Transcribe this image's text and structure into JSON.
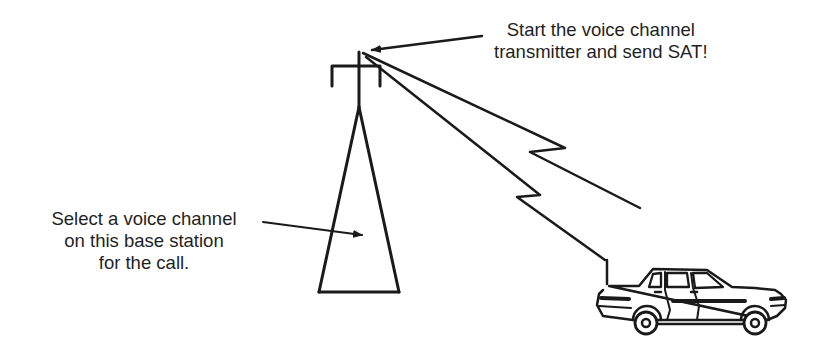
{
  "diagram": {
    "type": "cellular-call-setup-illustration",
    "elements": {
      "base_station": {
        "icon": "cell-tower-icon"
      },
      "radio_link": {
        "icon": "lightning-beam-icon"
      },
      "mobile_unit": {
        "icon": "car-icon"
      }
    },
    "annotations": {
      "tower_top": {
        "lines": [
          "Start the voice channel",
          "transmitter and send SAT!"
        ]
      },
      "tower_body": {
        "lines": [
          "Select a voice channel",
          "on this base station",
          "for the call."
        ]
      }
    },
    "colors": {
      "ink": "#1a1a1a",
      "background": "#ffffff"
    }
  }
}
